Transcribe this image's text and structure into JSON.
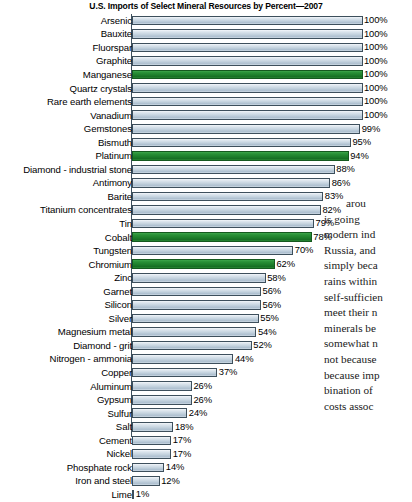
{
  "chart_data": {
    "type": "bar",
    "orientation": "horizontal",
    "title": "U.S. Imports of Select Mineral Resources by Percent—2007",
    "xlabel": "",
    "ylabel": "",
    "xlim": [
      0,
      100
    ],
    "grid": false,
    "legend": "none",
    "value_suffix": "%",
    "highlight_color": "#1c7d2a",
    "bar_color": "#c3d2de",
    "categories": [
      "Arsenic",
      "Bauxite",
      "Fluorspar",
      "Graphite",
      "Manganese",
      "Quartz crystals",
      "Rare earth elements",
      "Vanadium",
      "Gemstones",
      "Bismuth",
      "Platinum",
      "Diamond - industrial stone",
      "Antimony",
      "Barite",
      "Titanium concentrates",
      "Tin",
      "Cobalt",
      "Tungsten",
      "Chromium",
      "Zinc",
      "Garnet",
      "Silicon",
      "Silver",
      "Magnesium metal",
      "Diamond - grit",
      "Nitrogen - ammonia",
      "Copper",
      "Aluminum",
      "Gypsum",
      "Sulfur",
      "Salt",
      "Cement",
      "Nickel",
      "Phosphate rock",
      "Iron and steel",
      "Lime"
    ],
    "values": [
      100,
      100,
      100,
      100,
      100,
      100,
      100,
      100,
      99,
      95,
      94,
      88,
      86,
      83,
      82,
      79,
      78,
      70,
      62,
      58,
      56,
      56,
      55,
      54,
      52,
      44,
      37,
      26,
      26,
      24,
      18,
      17,
      17,
      14,
      12,
      1
    ],
    "value_labels": [
      "100%",
      "100%",
      "100%",
      "100%",
      "100%",
      "100%",
      "100%",
      "100%",
      "99%",
      "95%",
      "94%",
      "88%",
      "86%",
      "83%",
      "82%",
      "79%",
      "78%",
      "70%",
      "62%",
      "58%",
      "56%",
      "56%",
      "55%",
      "54%",
      "52%",
      "44%",
      "37%",
      "26%",
      "26%",
      "24%",
      "18%",
      "17%",
      "17%",
      "14%",
      "12%",
      "1%"
    ],
    "highlighted": [
      false,
      false,
      false,
      false,
      true,
      false,
      false,
      false,
      false,
      false,
      true,
      false,
      false,
      false,
      false,
      false,
      true,
      false,
      true,
      false,
      false,
      false,
      false,
      false,
      false,
      false,
      false,
      false,
      false,
      false,
      false,
      false,
      false,
      false,
      false,
      false
    ]
  },
  "body_text": {
    "lines": [
      "arou",
      "is going",
      "modern ind",
      "Russia, and",
      "simply beca",
      "rains within",
      "self-sufficien",
      "meet their n",
      "minerals be",
      "somewhat n",
      "not because",
      "because imp",
      "bination of",
      "costs assoc"
    ]
  }
}
